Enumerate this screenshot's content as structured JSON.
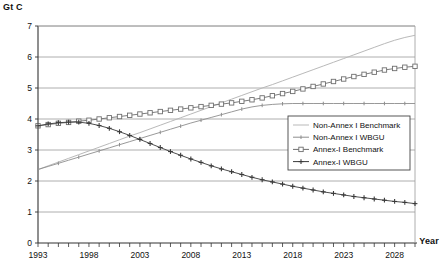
{
  "labels": {
    "y_axis_title": "Gt C",
    "x_axis_title": "Year"
  },
  "legend": {
    "items": [
      {
        "label": "Non-Annex I Benchmark",
        "color": "#b9b9b9",
        "marker": "none"
      },
      {
        "label": "Non-Annex I WBGU",
        "color": "#8d8d8d",
        "marker": "tick"
      },
      {
        "label": "Annex-I  Benchmark",
        "color": "#6e6e6e",
        "marker": "open-square"
      },
      {
        "label": "Annex-I  WBGU",
        "color": "#3a3a3a",
        "marker": "plus"
      }
    ]
  },
  "chart_data": {
    "type": "line",
    "title": "",
    "xlabel": "Year",
    "ylabel": "Gt C",
    "ylim": [
      0,
      7
    ],
    "xlim": [
      1993,
      2030
    ],
    "grid": true,
    "legend_position": "inside-right",
    "ytick_labels": [
      "0",
      "1",
      "2",
      "3",
      "4",
      "5",
      "6",
      "7"
    ],
    "xtick_labels": [
      "1993",
      "1998",
      "2003",
      "2008",
      "2013",
      "2018",
      "2023",
      "2028"
    ],
    "x": [
      1993,
      1994,
      1995,
      1996,
      1997,
      1998,
      1999,
      2000,
      2001,
      2002,
      2003,
      2004,
      2005,
      2006,
      2007,
      2008,
      2009,
      2010,
      2011,
      2012,
      2013,
      2014,
      2015,
      2016,
      2017,
      2018,
      2019,
      2020,
      2021,
      2022,
      2023,
      2024,
      2025,
      2026,
      2027,
      2028,
      2029,
      2030
    ],
    "series": [
      {
        "name": "Non-Annex I Benchmark",
        "color": "#b9b9b9",
        "marker": "none",
        "values": [
          2.37,
          2.49,
          2.61,
          2.73,
          2.85,
          2.97,
          3.09,
          3.21,
          3.33,
          3.45,
          3.56,
          3.68,
          3.8,
          3.92,
          4.04,
          4.16,
          4.28,
          4.4,
          4.52,
          4.64,
          4.76,
          4.88,
          5.0,
          5.11,
          5.23,
          5.35,
          5.47,
          5.59,
          5.71,
          5.83,
          5.95,
          6.07,
          6.19,
          6.31,
          6.43,
          6.54,
          6.63,
          6.7
        ]
      },
      {
        "name": "Non-Annex I WBGU",
        "color": "#8d8d8d",
        "marker": "tick",
        "values": [
          2.37,
          2.47,
          2.57,
          2.67,
          2.77,
          2.87,
          2.97,
          3.07,
          3.17,
          3.27,
          3.37,
          3.47,
          3.57,
          3.67,
          3.77,
          3.87,
          3.96,
          4.05,
          4.14,
          4.23,
          4.32,
          4.39,
          4.44,
          4.47,
          4.49,
          4.5,
          4.5,
          4.5,
          4.5,
          4.5,
          4.5,
          4.5,
          4.5,
          4.5,
          4.5,
          4.5,
          4.5,
          4.5
        ]
      },
      {
        "name": "Annex-I  Benchmark",
        "color": "#6e6e6e",
        "marker": "open-square",
        "values": [
          3.78,
          3.82,
          3.86,
          3.89,
          3.93,
          3.96,
          4.0,
          4.04,
          4.08,
          4.12,
          4.16,
          4.2,
          4.24,
          4.28,
          4.32,
          4.36,
          4.4,
          4.44,
          4.48,
          4.52,
          4.57,
          4.62,
          4.68,
          4.75,
          4.82,
          4.89,
          4.97,
          5.05,
          5.13,
          5.21,
          5.29,
          5.37,
          5.44,
          5.51,
          5.58,
          5.63,
          5.67,
          5.7
        ]
      },
      {
        "name": "Annex-I  WBGU",
        "color": "#3a3a3a",
        "marker": "plus",
        "values": [
          3.78,
          3.84,
          3.88,
          3.9,
          3.9,
          3.86,
          3.79,
          3.7,
          3.59,
          3.47,
          3.34,
          3.21,
          3.08,
          2.95,
          2.83,
          2.71,
          2.6,
          2.49,
          2.39,
          2.3,
          2.21,
          2.12,
          2.04,
          1.97,
          1.9,
          1.83,
          1.77,
          1.71,
          1.65,
          1.6,
          1.55,
          1.5,
          1.46,
          1.42,
          1.38,
          1.34,
          1.31,
          1.27
        ]
      }
    ]
  }
}
